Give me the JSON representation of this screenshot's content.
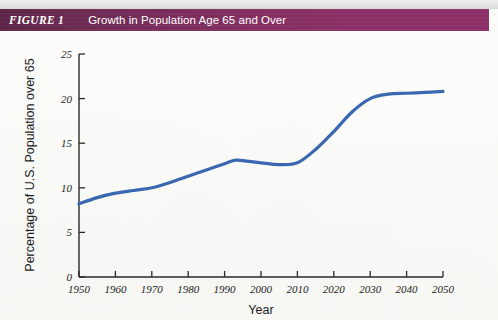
{
  "figure": {
    "label": "FIGURE 1",
    "title": "Growth in Population Age 65 and Over",
    "banner_color_left": "#5e2448",
    "banner_color_right": "#8e2f68",
    "banner_text_color": "#ffffff"
  },
  "page": {
    "background_color": "#fbfbf8"
  },
  "chart_data": {
    "type": "line",
    "title": "Growth in Population Age 65 and Over",
    "xlabel": "Year",
    "ylabel": "Percentage of U.S. Population over 65",
    "xlim": [
      1950,
      2050
    ],
    "ylim": [
      0,
      25
    ],
    "xticks": [
      1950,
      1960,
      1970,
      1980,
      1990,
      2000,
      2010,
      2020,
      2030,
      2040,
      2050
    ],
    "xtick_labels": [
      "1950",
      "1960",
      "1970",
      "1980",
      "1990",
      "2000",
      "2010",
      "2020",
      "2030",
      "2040",
      "2050"
    ],
    "yticks": [
      0,
      5,
      10,
      15,
      20,
      25
    ],
    "ytick_labels": [
      "0",
      "5",
      "10",
      "15",
      "20",
      "25"
    ],
    "grid": false,
    "legend": null,
    "line_color": "#3A69B2",
    "line_width": 3.2,
    "series": [
      {
        "name": "Percentage of U.S. Population over 65",
        "x": [
          1950,
          1955,
          1960,
          1965,
          1970,
          1975,
          1980,
          1985,
          1990,
          1993,
          1996,
          2000,
          2005,
          2010,
          2015,
          2020,
          2025,
          2030,
          2035,
          2040,
          2045,
          2050
        ],
        "values": [
          8.2,
          8.9,
          9.4,
          9.7,
          10.0,
          10.6,
          11.3,
          12.0,
          12.7,
          13.1,
          13.0,
          12.8,
          12.6,
          12.8,
          14.3,
          16.3,
          18.5,
          20.0,
          20.5,
          20.6,
          20.7,
          20.8
        ]
      }
    ]
  }
}
